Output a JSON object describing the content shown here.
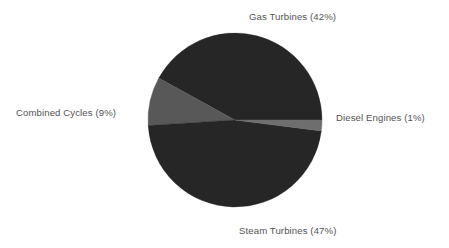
{
  "chart_data": {
    "type": "pie",
    "title": "",
    "subtitle": "",
    "xlabel": "",
    "ylabel": "",
    "legend_position": "none",
    "grid": false,
    "background_color": "#ffffff",
    "label_color": "#555555",
    "categories": [
      "Gas Turbines",
      "Steam Turbines",
      "Combined Cycles",
      "Diesel Engines"
    ],
    "values": [
      42,
      47,
      9,
      1
    ],
    "unit": "%",
    "slices": [
      {
        "name": "Gas Turbines",
        "value": 42,
        "label": "Gas Turbines (42%)",
        "color": "#262626",
        "start_angle": 0,
        "end_angle": 151.2,
        "label_position": "top"
      },
      {
        "name": "Combined Cycles",
        "value": 9,
        "label": "Combined Cycles (9%)",
        "color": "#585858",
        "start_angle": 151.2,
        "end_angle": 183.6,
        "label_position": "left"
      },
      {
        "name": "Steam Turbines",
        "value": 47,
        "label": "Steam Turbines (47%)",
        "color": "#262626",
        "start_angle": 183.6,
        "end_angle": 352.8,
        "label_position": "bottom"
      },
      {
        "name": "Diesel Engines",
        "value": 1,
        "label": "Diesel Engines (1%)",
        "color": "#6e6e6e",
        "start_angle": 352.8,
        "end_angle": 360,
        "label_position": "right"
      }
    ],
    "geometry": {
      "center_x": 235,
      "center_y": 120,
      "radius": 87
    }
  }
}
